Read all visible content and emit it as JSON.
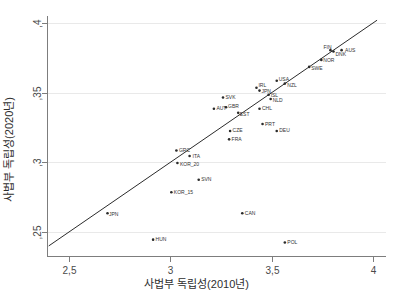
{
  "chart_data": {
    "type": "scatter",
    "title": "",
    "xlabel": "사법부 독립성(2010년)",
    "ylabel": "사법부 독립성(2020년)",
    "xlim": [
      2.4,
      4.02
    ],
    "ylim": [
      0.2405,
      0.4025
    ],
    "xticks": [
      2.5,
      3,
      3.5,
      4
    ],
    "xtick_labels": [
      "2,5",
      "3",
      "3,5",
      "4"
    ],
    "yticks": [
      0.25,
      0.3,
      0.35,
      0.4
    ],
    "ytick_labels": [
      ",25",
      ",3",
      ",35",
      ",4"
    ],
    "grid": "horizontal",
    "legend": "none",
    "marker_color": "#2b2b2b",
    "reference_line": {
      "name": "45-degree-line",
      "type": "identity",
      "slope": 1,
      "intercept": 0,
      "note": "y = x diagonal reference line",
      "color": "#2b2b2b",
      "from": [
        2.4,
        0.2405
      ],
      "to": [
        4.02,
        0.4025
      ]
    },
    "points": [
      {
        "label": "AUS",
        "x": 3.845,
        "y": 0.3805,
        "label_dx": 3.5,
        "label_dy": 1.5
      },
      {
        "label": "DNK",
        "x": 3.805,
        "y": 0.3795,
        "label_dx": 2.0,
        "label_dy": 4.5
      },
      {
        "label": "FIN",
        "x": 3.79,
        "y": 0.3805,
        "label_dx": -7.0,
        "label_dy": -1.0
      },
      {
        "label": "NOR",
        "x": 3.745,
        "y": 0.3735,
        "label_dx": 2.0,
        "label_dy": 2.0
      },
      {
        "label": "SWE",
        "x": 3.685,
        "y": 0.3685,
        "label_dx": 2.0,
        "label_dy": 3.0
      },
      {
        "label": "USA",
        "x": 3.525,
        "y": 0.3585,
        "label_dx": 2.0,
        "label_dy": 0.5
      },
      {
        "label": "NZL",
        "x": 3.565,
        "y": 0.3565,
        "label_dx": 2.5,
        "label_dy": 3.0
      },
      {
        "label": "IRL",
        "x": 3.425,
        "y": 0.3535,
        "label_dx": 2.0,
        "label_dy": -0.5
      },
      {
        "label": "JPN",
        "x": 3.44,
        "y": 0.3515,
        "label_dx": 2.0,
        "label_dy": 2.5
      },
      {
        "label": "ISL",
        "x": 3.485,
        "y": 0.3485,
        "label_dx": 2.0,
        "label_dy": 2.0
      },
      {
        "label": "NLD",
        "x": 3.495,
        "y": 0.3455,
        "label_dx": 2.0,
        "label_dy": 3.0
      },
      {
        "label": "SVK",
        "x": 3.26,
        "y": 0.3465,
        "label_dx": 2.5,
        "label_dy": 1.5
      },
      {
        "label": "AUT",
        "x": 3.215,
        "y": 0.3385,
        "label_dx": 2.5,
        "label_dy": 1.5
      },
      {
        "label": "GBR",
        "x": 3.275,
        "y": 0.3395,
        "label_dx": 2.0,
        "label_dy": 0.5
      },
      {
        "label": "EST",
        "x": 3.335,
        "y": 0.3355,
        "label_dx": 1.5,
        "label_dy": 3.5
      },
      {
        "label": "CHL",
        "x": 3.44,
        "y": 0.3385,
        "label_dx": 2.5,
        "label_dy": 1.5
      },
      {
        "label": "PRT",
        "x": 3.455,
        "y": 0.3275,
        "label_dx": 2.5,
        "label_dy": 1.5
      },
      {
        "label": "DEU",
        "x": 3.525,
        "y": 0.3225,
        "label_dx": 2.5,
        "label_dy": 1.5
      },
      {
        "label": "CZE",
        "x": 3.295,
        "y": 0.3225,
        "label_dx": 2.5,
        "label_dy": 1.5
      },
      {
        "label": "FRA",
        "x": 3.29,
        "y": 0.3165,
        "label_dx": 2.5,
        "label_dy": 1.5
      },
      {
        "label": "GRC",
        "x": 3.03,
        "y": 0.3085,
        "label_dx": 2.5,
        "label_dy": 1.5
      },
      {
        "label": "ITA",
        "x": 3.095,
        "y": 0.3045,
        "label_dx": 3.0,
        "label_dy": 1.5
      },
      {
        "label": "KOR_20",
        "x": 3.035,
        "y": 0.2995,
        "label_dx": 2.5,
        "label_dy": 3.0
      },
      {
        "label": "SVN",
        "x": 3.14,
        "y": 0.2875,
        "label_dx": 2.5,
        "label_dy": 1.5
      },
      {
        "label": "KOR_15",
        "x": 3.005,
        "y": 0.2785,
        "label_dx": 2.5,
        "label_dy": 1.5
      },
      {
        "label": "JPN",
        "x": 2.69,
        "y": 0.2635,
        "label_dx": 1.5,
        "label_dy": 3.0
      },
      {
        "label": "CAN",
        "x": 3.355,
        "y": 0.2635,
        "label_dx": 2.5,
        "label_dy": 1.5
      },
      {
        "label": "HUN",
        "x": 2.915,
        "y": 0.2445,
        "label_dx": 2.5,
        "label_dy": 1.5
      },
      {
        "label": "POL",
        "x": 3.565,
        "y": 0.2425,
        "label_dx": 2.5,
        "label_dy": 1.5
      }
    ]
  }
}
